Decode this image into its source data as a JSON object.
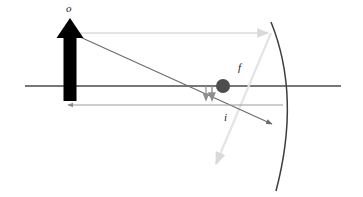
{
  "figure": {
    "kind": "optics-ray-diagram",
    "width": 363,
    "height": 197,
    "background": "#ffffff"
  },
  "labels": {
    "object": "o",
    "focus": "f",
    "image": "i"
  },
  "colors": {
    "optical_axis": "#4a4a4a",
    "object_arrow": "#000000",
    "incident_ray": "#6b6b6b",
    "reflected_ray": "#e2e2e2",
    "virtual_extension": "#8a8a8a",
    "mirror": "#3d3d3d",
    "focal_dot": "#4d4d4d",
    "image_arrow": "#7a7a7a",
    "label_text": "#1a1a1a"
  },
  "geometry": {
    "optical_axis": {
      "x1": 25,
      "y1": 86,
      "x2": 341,
      "y2": 86,
      "stroke_width": 1.6
    },
    "object_arrow": {
      "x": 70,
      "base_y": 101,
      "tip_y": 20,
      "shaft_width": 13,
      "head_width": 27,
      "head_height": 17
    },
    "mirror_arc": {
      "top": {
        "x": 271,
        "y": 22
      },
      "vertex": {
        "x": 296,
        "y": 96
      },
      "bottom": {
        "x": 276,
        "y": 191
      },
      "stroke_width": 1.5
    },
    "focal_dot": {
      "cx": 223,
      "cy": 86,
      "r": 7
    },
    "incident_parallel_ray": {
      "x1": 79,
      "y1": 33,
      "x2": 271,
      "y2": 33,
      "arrow": "end",
      "stroke_width": 1.1
    },
    "reflected_ray": {
      "x1": 271,
      "y1": 33,
      "x2": 214,
      "y2": 168,
      "arrow": "end",
      "stroke_width": 2.0
    },
    "chief_ray": {
      "x1": 80,
      "y1": 37,
      "x2": 275,
      "y2": 126,
      "arrow": "end",
      "stroke_width": 1.1
    },
    "image_distance_line": {
      "x1": 283,
      "y1": 105,
      "x2": 64,
      "y2": 105,
      "arrow": "end",
      "stroke_width": 1.0
    },
    "image_arrow": {
      "x": 212,
      "y1": 86,
      "y2": 104,
      "stroke_width": 1.4
    }
  }
}
